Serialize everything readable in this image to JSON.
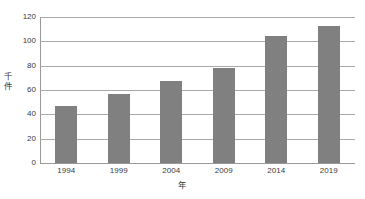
{
  "chart_data": {
    "type": "bar",
    "title": "",
    "subtitle": "",
    "categories": [
      "1994",
      "1999",
      "2004",
      "2009",
      "2014",
      "2019"
    ],
    "values": [
      47,
      57,
      67,
      78,
      104,
      113
    ],
    "series": [
      {
        "name": "件数",
        "values": [
          47,
          57,
          67,
          78,
          104,
          113
        ]
      }
    ],
    "xlabel": "年",
    "ylabel": "千件",
    "ylabel_chars": [
      "千",
      "件"
    ],
    "ylim": [
      0,
      120
    ],
    "y_ticks": [
      0,
      20,
      40,
      60,
      80,
      100,
      120
    ],
    "y_tick_labels": [
      "0",
      "20",
      "40",
      "60",
      "80",
      "100",
      "120"
    ],
    "x_tick_labels": [
      "1994",
      "1999",
      "2004",
      "2009",
      "2014",
      "2019"
    ],
    "grid": true,
    "grid_axis": "y",
    "legend": false,
    "legend_position": "none",
    "annotations": []
  },
  "style": {
    "bar_color": "#808080",
    "gridline_color": "#aaaaaa",
    "axis_color": "#999999",
    "text_color": "#3a3a3a",
    "background": "#ffffff"
  }
}
